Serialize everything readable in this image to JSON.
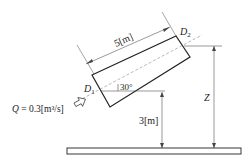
{
  "diagram": {
    "length_label": "5[m]",
    "inlet_label": "D",
    "inlet_sub": "1",
    "outlet_label": "D",
    "outlet_sub": "2",
    "angle_label": "30°",
    "flow_label_q": "Q",
    "flow_label_rest": " = 0.3[m³/s]",
    "height_label": "3[m]",
    "z_label": "Z"
  },
  "colors": {
    "line": "#222222",
    "thin": "#555555",
    "dashed": "#888888"
  }
}
